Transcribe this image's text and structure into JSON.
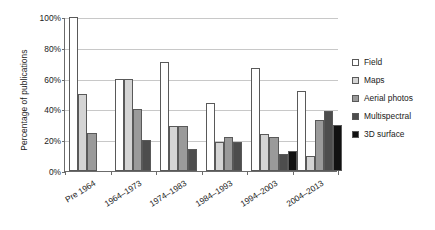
{
  "chart_data": {
    "type": "bar",
    "title": "",
    "xlabel": "",
    "ylabel": "Percentage of publications",
    "ylim": [
      0,
      100
    ],
    "grid": true,
    "legend_position": "right",
    "ytick_labels": [
      "0%",
      "20%",
      "40%",
      "60%",
      "80%",
      "100%"
    ],
    "ytick_values": [
      0,
      20,
      40,
      60,
      80,
      100
    ],
    "categories": [
      "Pre 1964",
      "1964–1973",
      "1974–1983",
      "1984–1993",
      "1994–2003",
      "2004–2013"
    ],
    "series": [
      {
        "name": "Field",
        "color": "#ffffff",
        "values": [
          100,
          60,
          71,
          44,
          67,
          52
        ]
      },
      {
        "name": "Maps",
        "color": "#d4d4d4",
        "values": [
          50,
          60,
          29,
          19,
          24,
          10
        ]
      },
      {
        "name": "Aerial photos",
        "color": "#9a9a9a",
        "values": [
          25,
          40,
          29,
          22,
          22,
          33
        ]
      },
      {
        "name": "Multispectral",
        "color": "#4d4d4d",
        "values": [
          0,
          20,
          14,
          19,
          11,
          39
        ]
      },
      {
        "name": "3D surface",
        "color": "#111111",
        "values": [
          0,
          0,
          0,
          0,
          13,
          30
        ]
      }
    ]
  },
  "legend": {
    "items": [
      {
        "label": "Field"
      },
      {
        "label": "Maps"
      },
      {
        "label": "Aerial photos"
      },
      {
        "label": "Multispectral"
      },
      {
        "label": "3D surface"
      }
    ]
  }
}
